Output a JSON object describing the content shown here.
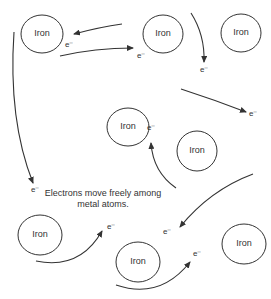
{
  "diagram": {
    "atom_label": "Iron",
    "electron_label": "e⁻",
    "caption_line1": "Electrons move freely among",
    "caption_line2": "metal atoms.",
    "stroke_color": "#333333",
    "atoms": [
      {
        "label": "Iron",
        "cx": 42,
        "cy": 34,
        "rx": 21,
        "ry": 19
      },
      {
        "label": "Iron",
        "cx": 163,
        "cy": 34,
        "rx": 20,
        "ry": 19
      },
      {
        "label": "Iron",
        "cx": 241,
        "cy": 33,
        "rx": 20,
        "ry": 19
      },
      {
        "label": "Iron",
        "cx": 128,
        "cy": 127,
        "rx": 21,
        "ry": 19
      },
      {
        "label": "Iron",
        "cx": 197,
        "cy": 151,
        "rx": 20,
        "ry": 20
      },
      {
        "label": "Iron",
        "cx": 40,
        "cy": 235,
        "rx": 22,
        "ry": 20
      },
      {
        "label": "Iron",
        "cx": 138,
        "cy": 262,
        "rx": 22,
        "ry": 20
      },
      {
        "label": "Iron",
        "cx": 244,
        "cy": 244,
        "rx": 22,
        "ry": 20
      }
    ],
    "electrons": [
      {
        "label": "e⁻",
        "x": 65,
        "y": 47
      },
      {
        "label": "e⁻",
        "x": 137,
        "y": 58
      },
      {
        "label": "e⁻",
        "x": 200,
        "y": 72
      },
      {
        "label": "e⁻",
        "x": 249,
        "y": 116
      },
      {
        "label": "e⁻",
        "x": 147,
        "y": 130
      },
      {
        "label": "e⁻",
        "x": 31,
        "y": 192
      },
      {
        "label": "e⁻",
        "x": 107,
        "y": 229
      },
      {
        "label": "e⁻",
        "x": 163,
        "y": 234
      },
      {
        "label": "e⁻",
        "x": 193,
        "y": 256
      }
    ]
  }
}
